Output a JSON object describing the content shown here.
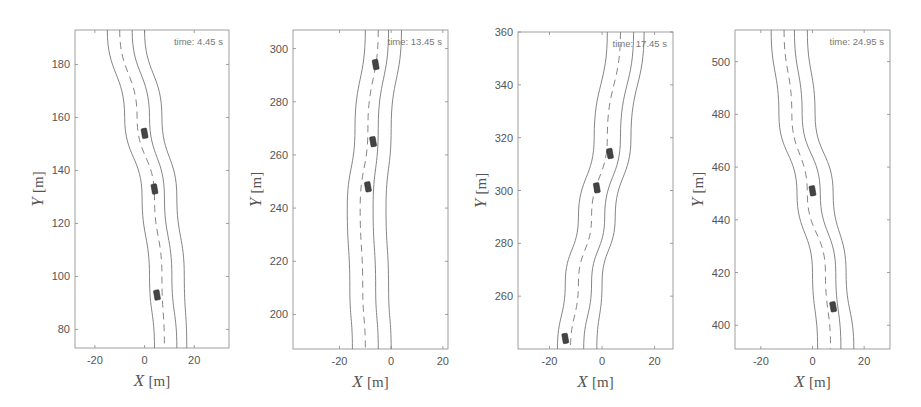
{
  "chart_data": [
    {
      "type": "line",
      "title": "",
      "annotation": "time: 4.45 s",
      "xlabel": "X [m]",
      "ylabel": "Y [m]",
      "xlim": [
        -28,
        34
      ],
      "ylim": [
        73,
        193
      ],
      "xticks": [
        -20,
        0,
        20
      ],
      "yticks": [
        80,
        100,
        120,
        140,
        160,
        180
      ],
      "grid": false,
      "box_px": {
        "left": 75,
        "top": 30,
        "right": 229,
        "bottom": 348
      },
      "series": [
        {
          "name": "left road edge",
          "style": "solid",
          "points": [
            [
              -15,
              193
            ],
            [
              -8,
              160
            ],
            [
              -1,
              130
            ],
            [
              2,
              100
            ],
            [
              4,
              73
            ]
          ]
        },
        {
          "name": "lane center",
          "style": "dashed",
          "points": [
            [
              -10,
              193
            ],
            [
              -3,
              160
            ],
            [
              4,
              130
            ],
            [
              7,
              100
            ],
            [
              8,
              73
            ]
          ]
        },
        {
          "name": "lane divider",
          "style": "solid",
          "points": [
            [
              -5,
              193
            ],
            [
              2,
              160
            ],
            [
              8,
              130
            ],
            [
              11,
              100
            ],
            [
              13,
              73
            ]
          ]
        },
        {
          "name": "right road edge",
          "style": "solid",
          "points": [
            [
              0,
              193
            ],
            [
              7,
              160
            ],
            [
              13,
              130
            ],
            [
              16,
              100
            ],
            [
              17,
              73
            ]
          ]
        }
      ],
      "vehicles": [
        {
          "x": 0,
          "y": 154
        },
        {
          "x": 4,
          "y": 133
        },
        {
          "x": 5,
          "y": 93
        }
      ]
    },
    {
      "type": "line",
      "title": "",
      "annotation": "time: 13.45 s",
      "xlabel": "X [m]",
      "ylabel": "Y [m]",
      "xlim": [
        -38,
        22
      ],
      "ylim": [
        187,
        307
      ],
      "xticks": [
        -20,
        0,
        20
      ],
      "yticks": [
        200,
        220,
        240,
        260,
        280,
        300
      ],
      "grid": false,
      "box_px": {
        "left": 293,
        "top": 30,
        "right": 448,
        "bottom": 349
      },
      "series": [
        {
          "name": "left road edge",
          "style": "solid",
          "points": [
            [
              -10,
              307
            ],
            [
              -14,
              270
            ],
            [
              -17,
              240
            ],
            [
              -16,
              210
            ],
            [
              -15,
              187
            ]
          ]
        },
        {
          "name": "lane center",
          "style": "dashed",
          "points": [
            [
              -5,
              307
            ],
            [
              -9,
              270
            ],
            [
              -12,
              240
            ],
            [
              -11,
              210
            ],
            [
              -10,
              187
            ]
          ]
        },
        {
          "name": "lane divider",
          "style": "solid",
          "points": [
            [
              -1,
              307
            ],
            [
              -5,
              270
            ],
            [
              -7,
              240
            ],
            [
              -6,
              210
            ],
            [
              -5,
              187
            ]
          ]
        },
        {
          "name": "right road edge",
          "style": "solid",
          "points": [
            [
              4,
              307
            ],
            [
              0,
              270
            ],
            [
              -2,
              240
            ],
            [
              -1,
              210
            ],
            [
              0,
              187
            ]
          ]
        }
      ],
      "vehicles": [
        {
          "x": -6,
          "y": 294
        },
        {
          "x": -7,
          "y": 265
        },
        {
          "x": -9,
          "y": 248
        }
      ]
    },
    {
      "type": "line",
      "title": "",
      "annotation": "time: 17.45 s",
      "xlabel": "X [m]",
      "ylabel": "Y [m]",
      "xlim": [
        -32,
        27
      ],
      "ylim": [
        240,
        360
      ],
      "xticks": [
        -20,
        0,
        20
      ],
      "yticks": [
        260,
        280,
        300,
        320,
        340,
        360
      ],
      "grid": false,
      "box_px": {
        "left": 518,
        "top": 32,
        "right": 673,
        "bottom": 349
      },
      "series": [
        {
          "name": "left road edge",
          "style": "solid",
          "points": [
            [
              2,
              360
            ],
            [
              -3,
              320
            ],
            [
              -9,
              290
            ],
            [
              -14,
              265
            ],
            [
              -17,
              240
            ]
          ]
        },
        {
          "name": "lane center",
          "style": "dashed",
          "points": [
            [
              7,
              360
            ],
            [
              2,
              320
            ],
            [
              -4,
              290
            ],
            [
              -9,
              265
            ],
            [
              -12,
              240
            ]
          ]
        },
        {
          "name": "lane divider",
          "style": "solid",
          "points": [
            [
              12,
              360
            ],
            [
              7,
              320
            ],
            [
              1,
              290
            ],
            [
              -4,
              265
            ],
            [
              -7,
              240
            ]
          ]
        },
        {
          "name": "right road edge",
          "style": "solid",
          "points": [
            [
              16,
              360
            ],
            [
              11,
              320
            ],
            [
              5,
              290
            ],
            [
              0,
              265
            ],
            [
              -2,
              240
            ]
          ]
        }
      ],
      "vehicles": [
        {
          "x": 3,
          "y": 314
        },
        {
          "x": -2,
          "y": 301
        },
        {
          "x": -14,
          "y": 244
        }
      ]
    },
    {
      "type": "line",
      "title": "",
      "annotation": "time: 24.95 s",
      "xlabel": "X [m]",
      "ylabel": "Y [m]",
      "xlim": [
        -30,
        30
      ],
      "ylim": [
        391,
        512
      ],
      "xticks": [
        -20,
        0,
        20
      ],
      "yticks": [
        400,
        420,
        440,
        460,
        480,
        500
      ],
      "grid": false,
      "box_px": {
        "left": 735,
        "top": 30,
        "right": 890,
        "bottom": 349
      },
      "series": [
        {
          "name": "left road edge",
          "style": "solid",
          "points": [
            [
              -16,
              512
            ],
            [
              -13,
              480
            ],
            [
              -6,
              450
            ],
            [
              0,
              420
            ],
            [
              2,
              391
            ]
          ]
        },
        {
          "name": "lane center",
          "style": "dashed",
          "points": [
            [
              -11,
              512
            ],
            [
              -8,
              480
            ],
            [
              -2,
              450
            ],
            [
              5,
              420
            ],
            [
              7,
              391
            ]
          ]
        },
        {
          "name": "lane divider",
          "style": "solid",
          "points": [
            [
              -7,
              512
            ],
            [
              -4,
              480
            ],
            [
              3,
              450
            ],
            [
              9,
              420
            ],
            [
              11,
              391
            ]
          ]
        },
        {
          "name": "right road edge",
          "style": "solid",
          "points": [
            [
              -2,
              512
            ],
            [
              1,
              480
            ],
            [
              8,
              450
            ],
            [
              13,
              420
            ],
            [
              16,
              391
            ]
          ]
        }
      ],
      "vehicles": [
        {
          "x": 0,
          "y": 451
        },
        {
          "x": 8,
          "y": 407
        }
      ]
    }
  ],
  "colors": {
    "axis": "#888888",
    "road_line": "#777777",
    "vehicle": "#444444",
    "text": "#555555"
  }
}
